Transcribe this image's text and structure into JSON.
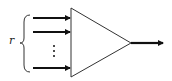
{
  "diagram": {
    "type": "multi-input single-output block (triangle)",
    "brace_label": "r",
    "inputs": [
      {
        "y": 18
      },
      {
        "y": 32
      },
      {
        "y": 68
      }
    ],
    "ellipsis": "⋮",
    "output": {
      "y": 43
    },
    "colors": {
      "stroke": "#111111",
      "background": "#ffffff"
    }
  }
}
